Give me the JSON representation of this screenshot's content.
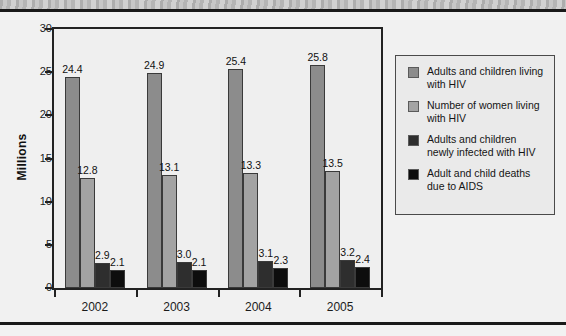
{
  "chart_data": {
    "type": "bar",
    "title": "",
    "xlabel": "",
    "ylabel": "Millions",
    "ylim": [
      0,
      30
    ],
    "yticks": [
      "0",
      "5",
      "10",
      "15",
      "20",
      "25",
      "30"
    ],
    "grid": false,
    "legend_position": "right",
    "categories": [
      "2002",
      "2003",
      "2004",
      "2005"
    ],
    "series": [
      {
        "name": "Adults and children living with HIV",
        "color": "#8c8c8c",
        "values": [
          24.4,
          24.9,
          25.4,
          25.8
        ],
        "labels": [
          "24.4",
          "24.9",
          "25.4",
          "25.8"
        ]
      },
      {
        "name": "Number of women living with HIV",
        "color": "#a3a3a3",
        "values": [
          12.8,
          13.1,
          13.3,
          13.5
        ],
        "labels": [
          "12.8",
          "13.1",
          "13.3",
          "13.5"
        ]
      },
      {
        "name": "Adults and children newly infected with HIV",
        "color": "#2e2e2e",
        "values": [
          2.9,
          3.0,
          3.1,
          3.2
        ],
        "labels": [
          "2.9",
          "3.0",
          "3.1",
          "3.2"
        ]
      },
      {
        "name": "Adult and child deaths due to AIDS",
        "color": "#0d0d0d",
        "values": [
          2.1,
          2.1,
          2.3,
          2.4
        ],
        "labels": [
          "2.1",
          "2.1",
          "2.3",
          "2.4"
        ]
      }
    ]
  },
  "legend": {
    "items": [
      {
        "label": "Adults and children living with HIV",
        "color": "#8c8c8c"
      },
      {
        "label": "Number of women living with HIV",
        "color": "#a3a3a3"
      },
      {
        "label": "Adults and children newly infected with HIV",
        "color": "#2e2e2e"
      },
      {
        "label": "Adult and child deaths due to AIDS",
        "color": "#0d0d0d"
      }
    ]
  }
}
